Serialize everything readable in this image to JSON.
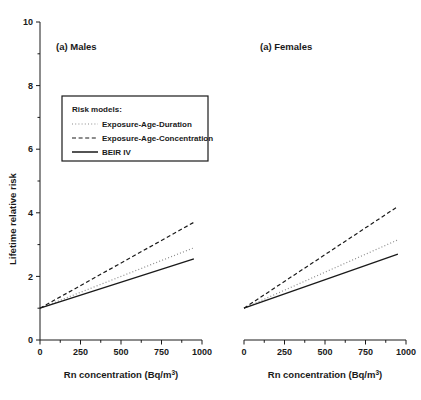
{
  "chart_data": {
    "type": "line",
    "title": "",
    "xlabel": "Rn concentration (Bq/m3)",
    "xlabel_base": "Rn concentration (Bq/m",
    "xlabel_sup": "3",
    "xlabel_tail": ")",
    "ylabel": "Lifetime relative risk",
    "xlim": [
      0,
      1000
    ],
    "ylim": [
      0,
      10
    ],
    "xticks": [
      0,
      250,
      500,
      750,
      1000
    ],
    "xtick_labels": [
      "0",
      "250",
      "500",
      "750",
      "1000"
    ],
    "xminor_ticks": [
      125,
      375,
      625,
      875
    ],
    "yticks": [
      0,
      2,
      4,
      6,
      8,
      10
    ],
    "ytick_labels": [
      "0",
      "2",
      "4",
      "6",
      "8",
      "10"
    ],
    "yminor_ticks": [
      1,
      3,
      5,
      7,
      9
    ],
    "grid": false,
    "legend_position": "upper-left",
    "legend_title": "Risk models:",
    "x": [
      0,
      950
    ],
    "panels": [
      {
        "key": "males",
        "label": "(a) Males",
        "series": [
          {
            "name": "Exposure-Age-Duration",
            "style": "dotted",
            "color": "#8c8c8c",
            "values": [
              1.0,
              2.9
            ]
          },
          {
            "name": "Exposure-Age-Concentration",
            "style": "dashed",
            "color": "#1a1a1a",
            "values": [
              1.0,
              3.7
            ]
          },
          {
            "name": "BEIR IV",
            "style": "solid",
            "color": "#1a1a1a",
            "values": [
              1.0,
              2.55
            ]
          }
        ]
      },
      {
        "key": "females",
        "label": "(a) Females",
        "series": [
          {
            "name": "Exposure-Age-Duration",
            "style": "dotted",
            "color": "#8c8c8c",
            "values": [
              1.0,
              3.15
            ]
          },
          {
            "name": "Exposure-Age-Concentration",
            "style": "dashed",
            "color": "#1a1a1a",
            "values": [
              1.0,
              4.2
            ]
          },
          {
            "name": "BEIR IV",
            "style": "solid",
            "color": "#1a1a1a",
            "values": [
              1.0,
              2.7
            ]
          }
        ]
      }
    ],
    "legend_entries": [
      {
        "name": "Exposure-Age-Duration",
        "style": "dotted",
        "color": "#8c8c8c"
      },
      {
        "name": "Exposure-Age-Concentration",
        "style": "dashed",
        "color": "#1a1a1a"
      },
      {
        "name": "BEIR IV",
        "style": "solid",
        "color": "#1a1a1a"
      }
    ]
  }
}
